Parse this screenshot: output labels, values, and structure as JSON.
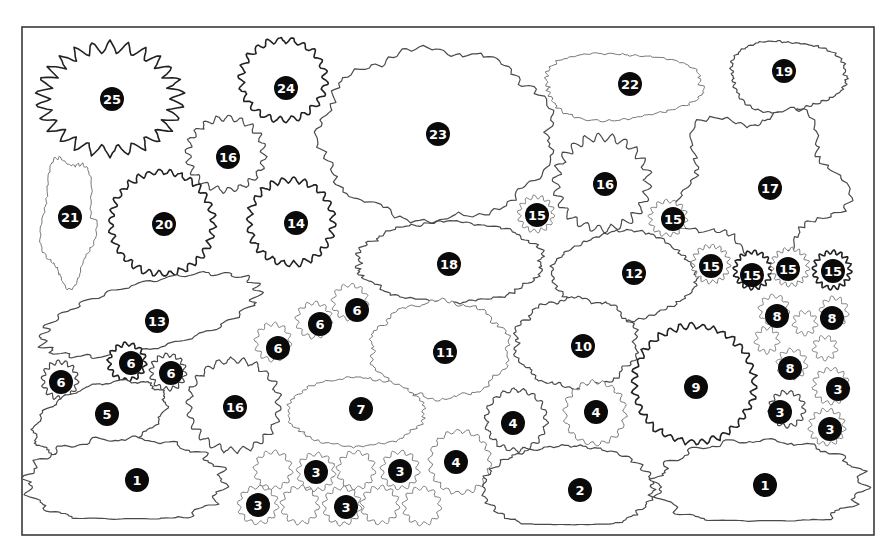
{
  "diagram": {
    "type": "garden-planting-plan",
    "border": {
      "x": 22,
      "y": 27,
      "width": 852,
      "height": 508
    },
    "marker_color": "#0a0a0a",
    "marker_text_color": "#ffffff",
    "outline_color": "#4a4a4a"
  },
  "plants": [
    {
      "id": "25",
      "label": "25",
      "shape": "spiky",
      "cx": 110,
      "cy": 99,
      "rx": 72,
      "ry": 55,
      "bumps": 26,
      "amp": 11,
      "mx": 112,
      "my": 99,
      "style": "bold"
    },
    {
      "id": "24",
      "label": "24",
      "shape": "wavy",
      "cx": 283,
      "cy": 80,
      "rx": 42,
      "ry": 40,
      "bumps": 22,
      "amp": 3,
      "mx": 286,
      "my": 88,
      "style": "bold"
    },
    {
      "id": "16a",
      "label": "16",
      "shape": "wavy",
      "cx": 226,
      "cy": 154,
      "rx": 38,
      "ry": 36,
      "bumps": 20,
      "amp": 3,
      "mx": 228,
      "my": 157,
      "style": ""
    },
    {
      "id": "21",
      "label": "21",
      "shape": "blob",
      "cx": 68,
      "cy": 220,
      "rx": 26,
      "ry": 62,
      "bumps": 14,
      "amp": 3,
      "mx": 70,
      "my": 217,
      "style": "faint"
    },
    {
      "id": "20",
      "label": "20",
      "shape": "wavy",
      "cx": 162,
      "cy": 223,
      "rx": 51,
      "ry": 51,
      "bumps": 30,
      "amp": 3,
      "mx": 164,
      "my": 224,
      "style": "bold"
    },
    {
      "id": "14",
      "label": "14",
      "shape": "wavy",
      "cx": 291,
      "cy": 222,
      "rx": 42,
      "ry": 42,
      "bumps": 24,
      "amp": 3,
      "mx": 296,
      "my": 223,
      "style": "bold"
    },
    {
      "id": "23",
      "label": "23",
      "shape": "cloud",
      "cx": 436,
      "cy": 135,
      "rx": 115,
      "ry": 84,
      "bumps": 9,
      "amp": 10,
      "mx": 438,
      "my": 134,
      "style": ""
    },
    {
      "id": "22",
      "label": "22",
      "shape": "blob",
      "cx": 620,
      "cy": 86,
      "rx": 78,
      "ry": 34,
      "bumps": 10,
      "amp": 6,
      "mx": 630,
      "my": 84,
      "style": "faint"
    },
    {
      "id": "19",
      "label": "19",
      "shape": "blob",
      "cx": 786,
      "cy": 76,
      "rx": 57,
      "ry": 36,
      "bumps": 10,
      "amp": 4,
      "mx": 784,
      "my": 71,
      "style": ""
    },
    {
      "id": "16b",
      "label": "16",
      "shape": "wavy",
      "cx": 602,
      "cy": 183,
      "rx": 46,
      "ry": 46,
      "bumps": 22,
      "amp": 4,
      "mx": 605,
      "my": 184,
      "style": ""
    },
    {
      "id": "17",
      "label": "17",
      "shape": "star-blob",
      "cx": 760,
      "cy": 183,
      "rx": 78,
      "ry": 70,
      "bumps": 6,
      "amp": 14,
      "mx": 770,
      "my": 188,
      "style": ""
    },
    {
      "id": "15a",
      "label": "15",
      "shape": "wavy",
      "cx": 536,
      "cy": 214,
      "rx": 17,
      "ry": 17,
      "bumps": 14,
      "amp": 2,
      "mx": 537,
      "my": 215,
      "style": "faint"
    },
    {
      "id": "15b",
      "label": "15",
      "shape": "wavy",
      "cx": 668,
      "cy": 218,
      "rx": 18,
      "ry": 17,
      "bumps": 14,
      "amp": 2,
      "mx": 673,
      "my": 219,
      "style": "faint"
    },
    {
      "id": "18",
      "label": "18",
      "shape": "cloud",
      "cx": 450,
      "cy": 262,
      "rx": 92,
      "ry": 40,
      "bumps": 10,
      "amp": 5,
      "mx": 449,
      "my": 264,
      "style": ""
    },
    {
      "id": "12",
      "label": "12",
      "shape": "blob",
      "cx": 624,
      "cy": 276,
      "rx": 70,
      "ry": 44,
      "bumps": 12,
      "amp": 3,
      "mx": 634,
      "my": 273,
      "style": ""
    },
    {
      "id": "15c",
      "label": "15",
      "shape": "wavy",
      "cx": 711,
      "cy": 264,
      "rx": 18,
      "ry": 18,
      "bumps": 16,
      "amp": 2,
      "mx": 711,
      "my": 266,
      "style": "faint"
    },
    {
      "id": "15d",
      "label": "15",
      "shape": "wavy",
      "cx": 753,
      "cy": 270,
      "rx": 18,
      "ry": 18,
      "bumps": 16,
      "amp": 2,
      "mx": 752,
      "my": 275,
      "style": "bold"
    },
    {
      "id": "15e",
      "label": "15",
      "shape": "wavy",
      "cx": 790,
      "cy": 267,
      "rx": 18,
      "ry": 18,
      "bumps": 16,
      "amp": 2,
      "mx": 788,
      "my": 269,
      "style": "faint"
    },
    {
      "id": "15f",
      "label": "15",
      "shape": "wavy",
      "cx": 832,
      "cy": 270,
      "rx": 18,
      "ry": 18,
      "bumps": 16,
      "amp": 2,
      "mx": 833,
      "my": 271,
      "style": "bold"
    },
    {
      "id": "13",
      "label": "13",
      "shape": "leaf",
      "cx": 150,
      "cy": 315,
      "rx": 108,
      "ry": 34,
      "bumps": 22,
      "amp": 3,
      "mx": 157,
      "my": 321,
      "style": ""
    },
    {
      "id": "6a",
      "label": "6",
      "shape": "wavy",
      "cx": 350,
      "cy": 302,
      "rx": 17,
      "ry": 17,
      "bumps": 12,
      "amp": 2,
      "mx": 357,
      "my": 310,
      "style": "faint"
    },
    {
      "id": "6b",
      "label": "6",
      "shape": "wavy",
      "cx": 314,
      "cy": 320,
      "rx": 17,
      "ry": 17,
      "bumps": 12,
      "amp": 2,
      "mx": 320,
      "my": 324,
      "style": "faint"
    },
    {
      "id": "6c",
      "label": "6",
      "shape": "wavy",
      "cx": 273,
      "cy": 342,
      "rx": 17,
      "ry": 18,
      "bumps": 12,
      "amp": 2,
      "mx": 278,
      "my": 348,
      "style": "faint"
    },
    {
      "id": "6d",
      "label": "6",
      "shape": "wavy",
      "cx": 127,
      "cy": 362,
      "rx": 18,
      "ry": 18,
      "bumps": 14,
      "amp": 2,
      "mx": 131,
      "my": 363,
      "style": "bold"
    },
    {
      "id": "6e",
      "label": "6",
      "shape": "wavy",
      "cx": 168,
      "cy": 372,
      "rx": 17,
      "ry": 17,
      "bumps": 14,
      "amp": 2,
      "mx": 171,
      "my": 373,
      "style": ""
    },
    {
      "id": "6f",
      "label": "6",
      "shape": "wavy",
      "cx": 60,
      "cy": 380,
      "rx": 17,
      "ry": 18,
      "bumps": 14,
      "amp": 2,
      "mx": 61,
      "my": 382,
      "style": ""
    },
    {
      "id": "11",
      "label": "11",
      "shape": "cloud",
      "cx": 440,
      "cy": 350,
      "rx": 68,
      "ry": 48,
      "bumps": 10,
      "amp": 6,
      "mx": 445,
      "my": 352,
      "style": "faint"
    },
    {
      "id": "10",
      "label": "10",
      "shape": "cloud",
      "cx": 576,
      "cy": 343,
      "rx": 60,
      "ry": 44,
      "bumps": 10,
      "amp": 6,
      "mx": 583,
      "my": 346,
      "style": ""
    },
    {
      "id": "9",
      "label": "9",
      "shape": "wavy",
      "cx": 694,
      "cy": 384,
      "rx": 60,
      "ry": 58,
      "bumps": 34,
      "amp": 3,
      "mx": 696,
      "my": 387,
      "style": "bold"
    },
    {
      "id": "8a",
      "label": "8",
      "shape": "wavy",
      "cx": 774,
      "cy": 310,
      "rx": 14,
      "ry": 14,
      "bumps": 10,
      "amp": 2,
      "mx": 777,
      "my": 316,
      "style": "faint"
    },
    {
      "id": "8b",
      "label": "8",
      "shape": "wavy",
      "cx": 834,
      "cy": 312,
      "rx": 13,
      "ry": 14,
      "bumps": 10,
      "amp": 2,
      "mx": 832,
      "my": 318,
      "style": "faint"
    },
    {
      "id": "8c",
      "label": "8",
      "shape": "wavy",
      "cx": 792,
      "cy": 364,
      "rx": 14,
      "ry": 14,
      "bumps": 10,
      "amp": 2,
      "mx": 790,
      "my": 368,
      "style": "faint"
    },
    {
      "id": "empty-a",
      "label": "",
      "shape": "wavy",
      "cx": 805,
      "cy": 323,
      "rx": 11,
      "ry": 11,
      "bumps": 9,
      "amp": 2,
      "mx": null,
      "my": null,
      "style": "faint"
    },
    {
      "id": "empty-b",
      "label": "",
      "shape": "wavy",
      "cx": 767,
      "cy": 340,
      "rx": 11,
      "ry": 12,
      "bumps": 9,
      "amp": 2,
      "mx": null,
      "my": null,
      "style": "faint"
    },
    {
      "id": "empty-c",
      "label": "",
      "shape": "wavy",
      "cx": 825,
      "cy": 348,
      "rx": 11,
      "ry": 11,
      "bumps": 9,
      "amp": 2,
      "mx": null,
      "my": null,
      "style": "faint"
    },
    {
      "id": "3r1",
      "label": "3",
      "shape": "wavy",
      "cx": 831,
      "cy": 386,
      "rx": 17,
      "ry": 17,
      "bumps": 13,
      "amp": 2,
      "mx": 838,
      "my": 389,
      "style": "faint"
    },
    {
      "id": "3r2",
      "label": "3",
      "shape": "wavy",
      "cx": 787,
      "cy": 409,
      "rx": 17,
      "ry": 17,
      "bumps": 13,
      "amp": 2,
      "mx": 780,
      "my": 412,
      "style": ""
    },
    {
      "id": "3r3",
      "label": "3",
      "shape": "wavy",
      "cx": 827,
      "cy": 427,
      "rx": 17,
      "ry": 17,
      "bumps": 13,
      "amp": 2,
      "mx": 830,
      "my": 429,
      "style": "faint"
    },
    {
      "id": "16c",
      "label": "16",
      "shape": "wavy",
      "cx": 234,
      "cy": 405,
      "rx": 45,
      "ry": 45,
      "bumps": 22,
      "amp": 3,
      "mx": 235,
      "my": 407,
      "style": ""
    },
    {
      "id": "5",
      "label": "5",
      "shape": "leaf",
      "cx": 100,
      "cy": 418,
      "rx": 66,
      "ry": 34,
      "bumps": 14,
      "amp": 3,
      "mx": 107,
      "my": 414,
      "style": ""
    },
    {
      "id": "7",
      "label": "7",
      "shape": "cloud",
      "cx": 356,
      "cy": 412,
      "rx": 68,
      "ry": 34,
      "bumps": 10,
      "amp": 3,
      "mx": 361,
      "my": 409,
      "style": "faint"
    },
    {
      "id": "4a",
      "label": "4",
      "shape": "wavy",
      "cx": 516,
      "cy": 420,
      "rx": 30,
      "ry": 30,
      "bumps": 18,
      "amp": 2,
      "mx": 513,
      "my": 423,
      "style": ""
    },
    {
      "id": "4b",
      "label": "4",
      "shape": "wavy",
      "cx": 595,
      "cy": 413,
      "rx": 30,
      "ry": 31,
      "bumps": 18,
      "amp": 2,
      "mx": 596,
      "my": 412,
      "style": "faint"
    },
    {
      "id": "4c",
      "label": "4",
      "shape": "wavy",
      "cx": 460,
      "cy": 462,
      "rx": 30,
      "ry": 31,
      "bumps": 18,
      "amp": 2,
      "mx": 456,
      "my": 462,
      "style": "faint"
    },
    {
      "id": "3a",
      "label": "3",
      "shape": "wavy",
      "cx": 273,
      "cy": 470,
      "rx": 18,
      "ry": 18,
      "bumps": 12,
      "amp": 2,
      "mx": null,
      "my": null,
      "style": "faint"
    },
    {
      "id": "3b",
      "label": "3",
      "shape": "wavy",
      "cx": 316,
      "cy": 472,
      "rx": 18,
      "ry": 18,
      "bumps": 12,
      "amp": 2,
      "mx": 316,
      "my": 472,
      "style": "faint"
    },
    {
      "id": "3c",
      "label": "3",
      "shape": "wavy",
      "cx": 356,
      "cy": 470,
      "rx": 18,
      "ry": 18,
      "bumps": 12,
      "amp": 2,
      "mx": null,
      "my": null,
      "style": "faint"
    },
    {
      "id": "3d",
      "label": "3",
      "shape": "wavy",
      "cx": 400,
      "cy": 470,
      "rx": 18,
      "ry": 18,
      "bumps": 12,
      "amp": 2,
      "mx": 400,
      "my": 471,
      "style": "faint"
    },
    {
      "id": "3e",
      "label": "3",
      "shape": "wavy",
      "cx": 258,
      "cy": 505,
      "rx": 19,
      "ry": 18,
      "bumps": 12,
      "amp": 2,
      "mx": 258,
      "my": 505,
      "style": "faint"
    },
    {
      "id": "3f",
      "label": "3",
      "shape": "wavy",
      "cx": 300,
      "cy": 505,
      "rx": 18,
      "ry": 18,
      "bumps": 12,
      "amp": 2,
      "mx": null,
      "my": null,
      "style": "faint"
    },
    {
      "id": "3g",
      "label": "3",
      "shape": "wavy",
      "cx": 342,
      "cy": 506,
      "rx": 18,
      "ry": 18,
      "bumps": 12,
      "amp": 2,
      "mx": 346,
      "my": 507,
      "style": "faint"
    },
    {
      "id": "3h",
      "label": "3",
      "shape": "wavy",
      "cx": 380,
      "cy": 505,
      "rx": 18,
      "ry": 18,
      "bumps": 12,
      "amp": 2,
      "mx": null,
      "my": null,
      "style": "faint"
    },
    {
      "id": "3i",
      "label": "3",
      "shape": "wavy",
      "cx": 422,
      "cy": 506,
      "rx": 18,
      "ry": 18,
      "bumps": 12,
      "amp": 2,
      "mx": null,
      "my": null,
      "style": "faint"
    },
    {
      "id": "1a",
      "label": "1",
      "shape": "spiky-base",
      "cx": 125,
      "cy": 482,
      "rx": 95,
      "ry": 42,
      "bumps": 16,
      "amp": 8,
      "mx": 137,
      "my": 480,
      "style": ""
    },
    {
      "id": "2",
      "label": "2",
      "shape": "dome",
      "cx": 568,
      "cy": 488,
      "rx": 85,
      "ry": 42,
      "bumps": 16,
      "amp": 3,
      "mx": 580,
      "my": 490,
      "style": ""
    },
    {
      "id": "1b",
      "label": "1",
      "shape": "spiky-base",
      "cx": 760,
      "cy": 484,
      "rx": 100,
      "ry": 42,
      "bumps": 16,
      "amp": 8,
      "mx": 765,
      "my": 485,
      "style": ""
    }
  ]
}
